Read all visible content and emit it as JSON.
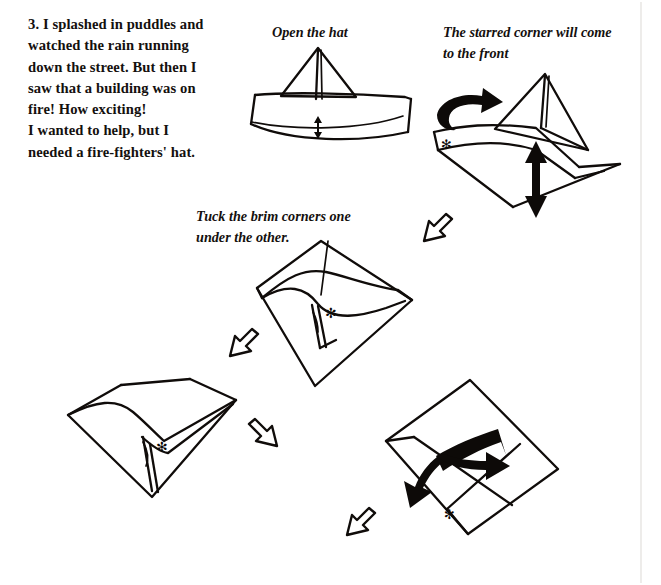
{
  "page": {
    "background_color": "#ffffff",
    "ink_color": "#100c0a",
    "width": 661,
    "height": 585
  },
  "story": {
    "step_number": "3.",
    "lines": [
      "3. I splashed in puddles and",
      "watched the rain running",
      "down the street. But then I",
      "saw that a building was on",
      "fire! How exciting!",
      "I wanted to help, but I",
      "needed a fire-fighters' hat."
    ],
    "full_text": "3. I splashed in puddles and watched the rain running down the street. But then I saw that a building was on fire! How exciting! I wanted to help, but I needed a fire-fighters' hat."
  },
  "captions": [
    {
      "id": "open-the-hat",
      "lines": [
        "Open the hat"
      ],
      "full_text": "Open the hat"
    },
    {
      "id": "starred-corner",
      "lines": [
        "The starred corner will come",
        "to the front"
      ],
      "full_text": "The starred corner will come to the front"
    },
    {
      "id": "tuck-brim",
      "lines": [
        "Tuck the brim corners one",
        "under the other."
      ],
      "full_text": "Tuck the brim corners one under the other."
    }
  ],
  "diagrams": [
    {
      "id": "hat-front-view",
      "name": "folded-paper-hat",
      "position": "top-center",
      "marks": [
        "double-headed-vertical-arrow"
      ]
    },
    {
      "id": "hat-opened",
      "name": "opened-hat-square",
      "position": "top-right",
      "marks": [
        "curved-turn-arrow",
        "double-headed-vertical-arrow",
        "star-mark"
      ]
    },
    {
      "id": "diamond-brim",
      "name": "diamond-with-brim",
      "position": "center",
      "marks": [
        "star-mark"
      ]
    },
    {
      "id": "diamond-tucked-left",
      "name": "diamond-brim-tucked",
      "position": "bottom-left",
      "marks": [
        "star-mark"
      ]
    },
    {
      "id": "diamond-flatten",
      "name": "diamond-flatten-arrows",
      "position": "bottom-right",
      "marks": [
        "bold-double-bent-arrow",
        "star-mark"
      ]
    }
  ],
  "flow_arrows": [
    {
      "id": "arrow-1",
      "name": "step-arrow-down-left",
      "direction": "down-left",
      "from": "hat-opened",
      "to": "diamond-brim"
    },
    {
      "id": "arrow-2",
      "name": "step-arrow-down-left-2",
      "direction": "down-left",
      "from": "diamond-brim",
      "to": "diamond-tucked-left"
    },
    {
      "id": "arrow-3",
      "name": "step-arrow-down-right",
      "direction": "down-right",
      "from": "diamond-tucked-left",
      "to": "diamond-flatten"
    },
    {
      "id": "arrow-4",
      "name": "step-arrow-down-left-3",
      "direction": "down-left",
      "from": "diamond-flatten",
      "to": "next-step"
    }
  ],
  "symbols": {
    "star_mark": "✻",
    "star_meaning": "starred corner"
  }
}
